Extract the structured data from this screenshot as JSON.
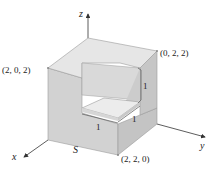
{
  "figure": {
    "axes": {
      "x": "x",
      "y": "y",
      "z": "z"
    },
    "surface_label": "S",
    "vertices": {
      "top_left": "(2, 0, 2)",
      "top_right": "(0, 2, 2)",
      "bottom_front": "(2, 2, 0)"
    },
    "notch_dimensions": {
      "height": "1",
      "depth": "1",
      "width": "1"
    }
  },
  "colors": {
    "top": "#e6e6e6",
    "left": "#d2d2d2",
    "right": "#c4c4c4",
    "inner_back": "#d9d9d9",
    "inner_side": "#c9c9c9",
    "inner_floor": "#ececec",
    "edge": "#9a9a9a",
    "axis": "#333333"
  }
}
